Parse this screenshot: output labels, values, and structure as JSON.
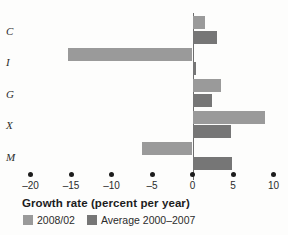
{
  "chart_data": {
    "type": "bar",
    "orientation": "horizontal",
    "title": "",
    "xlabel": "Growth rate (percent per year)",
    "ylabel": "",
    "categories": [
      "C",
      "I",
      "G",
      "X",
      "M"
    ],
    "series": [
      {
        "name": "2008/02",
        "color": "#9a9a9a",
        "values": [
          1.6,
          -15.4,
          3.5,
          9.0,
          -6.2
        ]
      },
      {
        "name": "Average 2000–2007",
        "color": "#767676",
        "values": [
          3.0,
          0.4,
          2.4,
          4.7,
          4.9
        ]
      }
    ],
    "xlim": [
      -20,
      10
    ],
    "xticks": [
      -20,
      -15,
      -10,
      -5,
      0,
      5,
      10
    ],
    "xticklabels": [
      "–20",
      "–15",
      "–10",
      "–5",
      "0",
      "5",
      "10"
    ],
    "grid": false,
    "zero_line": true,
    "tick_style": "dots",
    "legend_position": "bottom-left"
  },
  "legend": {
    "items": [
      {
        "label": "2008/02"
      },
      {
        "label": "Average 2000–2007"
      }
    ]
  }
}
